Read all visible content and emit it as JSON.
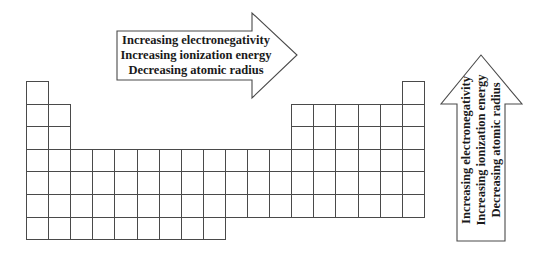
{
  "diagram": {
    "horizontal_arrow": {
      "direction": "right",
      "lines": [
        "Increasing electronegativity",
        "Increasing ionization energy",
        "Decreasing atomic radius"
      ]
    },
    "vertical_arrow": {
      "direction": "up",
      "lines": [
        "Increasing electronegativity",
        "Increasing ionization energy",
        "Decreasing atomic radius"
      ]
    },
    "table": {
      "columns": 18,
      "rows": 7,
      "grid": {
        "left": 26,
        "top": 81,
        "cell_w": 22.1,
        "cell_h": 22.6
      },
      "layout": "col1 rows1-7, col2 rows2-7, cols3-12 rows4-7 (row7 only cols1-9), cols13-17 rows2-6, col18 rows1-6"
    },
    "colors": {
      "line": "#4a4a4a",
      "background": "#ffffff",
      "text": "#1a1a1a"
    }
  }
}
